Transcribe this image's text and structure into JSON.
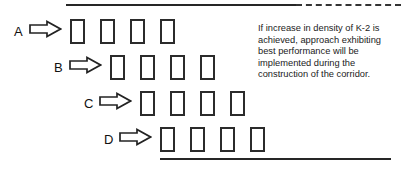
{
  "diagram": {
    "colors": {
      "line": "#262626",
      "box_stroke": "#2b2b2b",
      "text": "#1b1b1b",
      "background": "#ffffff"
    },
    "top_boundary": {
      "solid_label": "solid boundary segment",
      "dashed_label": "dashed boundary segment"
    },
    "bottom_boundary": {
      "solid_label": "solid boundary segment"
    },
    "rows": [
      {
        "label": "A",
        "arrow": "right-block-arrow",
        "units": 4,
        "unit_label": "unit-marker"
      },
      {
        "label": "B",
        "arrow": "right-block-arrow",
        "units": 4,
        "unit_label": "unit-marker"
      },
      {
        "label": "C",
        "arrow": "right-block-arrow",
        "units": 4,
        "unit_label": "unit-marker"
      },
      {
        "label": "D",
        "arrow": "right-block-arrow",
        "units": 4,
        "unit_label": "unit-marker"
      }
    ],
    "annotation": {
      "line1": "If increase in density of K-2 is",
      "line2": "achieved, approach exhibiting",
      "line3": "best performance will be",
      "line4": "implemented during the",
      "line5": "construction of the corridor."
    }
  }
}
